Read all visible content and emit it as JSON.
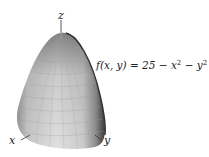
{
  "figure": {
    "surface": "paraboloid",
    "axes": {
      "z_label": "z",
      "x_label": "x",
      "y_label": "y"
    },
    "formula": {
      "lhs": "f(x, y) = 25 − x",
      "mid": " − y",
      "exp1": "2",
      "exp2": "2",
      "full": "f(x,y) = 25 − x² − y²"
    },
    "colors": {
      "surface_light": "#e6e6e6",
      "surface_mid": "#bdbdbd",
      "surface_dark": "#4a4a4a",
      "grid": "#a8a8a8"
    }
  }
}
